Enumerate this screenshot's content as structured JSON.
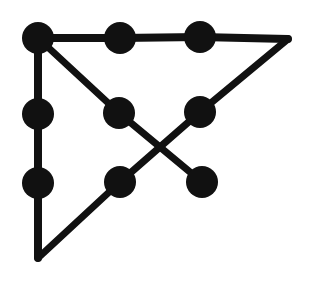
{
  "figure": {
    "kind": "node-link-diagram",
    "background_color": "#ffffff",
    "ink_color": "#111111",
    "canvas": {
      "width": 309,
      "height": 284
    }
  },
  "style": {
    "node_radius": 16,
    "node_fill": "#111111",
    "edge_color": "#111111",
    "edge_width": 7,
    "corner_edge_width": 8
  },
  "chart_data": {
    "type": "scatter",
    "xlabel": "",
    "ylabel": "",
    "xlim": [
      0,
      309
    ],
    "ylim": [
      0,
      284
    ],
    "grid": false,
    "legend": "none",
    "nodes": [
      {
        "id": "n1",
        "label": "top-left",
        "x": 38,
        "y": 38,
        "r": 16,
        "degree": 3
      },
      {
        "id": "n2",
        "label": "top-middle",
        "x": 120,
        "y": 38,
        "r": 16,
        "degree": 2
      },
      {
        "id": "n3",
        "label": "top-right",
        "x": 200,
        "y": 37,
        "r": 16,
        "degree": 2
      },
      {
        "id": "n4",
        "label": "left-middle",
        "x": 38,
        "y": 114,
        "r": 16,
        "degree": 2
      },
      {
        "id": "n5",
        "label": "center-left",
        "x": 119,
        "y": 113,
        "r": 16,
        "degree": 2
      },
      {
        "id": "n6",
        "label": "center-right",
        "x": 200,
        "y": 112,
        "r": 16,
        "degree": 2
      },
      {
        "id": "n7",
        "label": "left-lower",
        "x": 38,
        "y": 183,
        "r": 16,
        "degree": 2
      },
      {
        "id": "n8",
        "label": "center-bottom",
        "x": 120,
        "y": 182,
        "r": 16,
        "degree": 2
      },
      {
        "id": "n9",
        "label": "right-bottom",
        "x": 202,
        "y": 182,
        "r": 16,
        "degree": 1
      }
    ],
    "corners": [
      {
        "id": "c1",
        "label": "apex-right",
        "x": 288,
        "y": 39
      },
      {
        "id": "c2",
        "label": "apex-bottom",
        "x": 38,
        "y": 258
      }
    ],
    "edges": [
      {
        "from": "n1",
        "to": "n2",
        "kind": "straight"
      },
      {
        "from": "n2",
        "to": "n3",
        "kind": "straight"
      },
      {
        "from": "n3",
        "to": "c1",
        "kind": "straight"
      },
      {
        "from": "n1",
        "to": "n4",
        "kind": "straight"
      },
      {
        "from": "n4",
        "to": "n7",
        "kind": "straight"
      },
      {
        "from": "n7",
        "to": "c2",
        "kind": "straight"
      },
      {
        "from": "n1",
        "to": "n5",
        "kind": "diagonal"
      },
      {
        "from": "n5",
        "to": "n9",
        "kind": "diagonal-crossing"
      },
      {
        "from": "c1",
        "to": "n6",
        "kind": "diagonal"
      },
      {
        "from": "n6",
        "to": "n8",
        "kind": "diagonal-crossing"
      },
      {
        "from": "n8",
        "to": "c2",
        "kind": "diagonal"
      }
    ],
    "crossing_points": [
      {
        "label": "x-crossing",
        "x": 160,
        "y": 147
      }
    ],
    "counts": {
      "nodes": 9,
      "corners": 2,
      "edges": 11,
      "crossings": 1
    }
  }
}
